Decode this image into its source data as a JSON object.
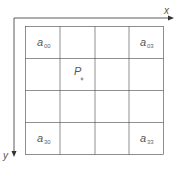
{
  "diagram": {
    "axes": {
      "x_label": "x",
      "y_label": "y"
    },
    "grid": {
      "rows": 4,
      "cols": 4
    },
    "cells": [
      {
        "id": "a00",
        "base": "a",
        "sub": "00",
        "row": 0,
        "col": 0
      },
      {
        "id": "a03",
        "base": "a",
        "sub": "03",
        "row": 0,
        "col": 3
      },
      {
        "id": "a30",
        "base": "a",
        "sub": "30",
        "row": 3,
        "col": 0
      },
      {
        "id": "a33",
        "base": "a",
        "sub": "33",
        "row": 3,
        "col": 3
      }
    ],
    "point": {
      "label": "P"
    },
    "colors": {
      "line": "#333333",
      "grid": "#444444",
      "text": "#555555",
      "point": "#999999"
    }
  }
}
